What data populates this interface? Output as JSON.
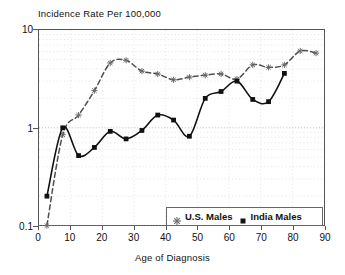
{
  "chart_title": "Incidence Rate Per 100,000",
  "axes": {
    "x_title": "Age of Diagnosis",
    "y_title": "Incidence Rate Per 100,000",
    "x_ticks": [
      "0",
      "10",
      "20",
      "30",
      "40",
      "50",
      "60",
      "70",
      "80",
      "90"
    ],
    "y_ticks": [
      "10",
      "1",
      "0.1"
    ]
  },
  "legend": {
    "items": [
      {
        "label": "U.S. Males",
        "marker": "star-marker",
        "line": "dashed",
        "color": "#4d4d4d"
      },
      {
        "label": "India Males",
        "marker": "square-marker",
        "line": "solid",
        "color": "#111111"
      }
    ]
  },
  "chart_data": {
    "type": "line",
    "title": "Incidence Rate Per 100,000",
    "xlabel": "Age of Diagnosis",
    "ylabel": "Incidence Rate Per 100,000",
    "yscale": "log",
    "xlim": [
      0,
      90
    ],
    "ylim": [
      0.1,
      10
    ],
    "grid": true,
    "legend_position": "bottom-right",
    "x": [
      2.5,
      7.5,
      12.5,
      17.5,
      22.5,
      27.5,
      32.5,
      37.5,
      42.5,
      47.5,
      52.5,
      57.5,
      62.5,
      67.5,
      72.5,
      77.5,
      82.5,
      87.5
    ],
    "series": [
      {
        "name": "U.S. Males",
        "marker": "star-marker",
        "line": "dashed",
        "color": "#4d4d4d",
        "values": [
          0.1,
          0.85,
          1.35,
          2.4,
          4.6,
          4.9,
          3.8,
          3.55,
          3.1,
          3.3,
          3.45,
          3.55,
          3.15,
          4.4,
          4.15,
          4.4,
          6.1,
          5.8
        ]
      },
      {
        "name": "India Males",
        "marker": "square-marker",
        "line": "solid",
        "color": "#111111",
        "values": [
          0.2,
          1.0,
          0.52,
          0.63,
          0.92,
          0.77,
          0.94,
          1.35,
          1.2,
          0.82,
          2.0,
          2.35,
          3.0,
          1.95,
          1.85,
          3.6,
          null,
          null
        ]
      }
    ]
  }
}
